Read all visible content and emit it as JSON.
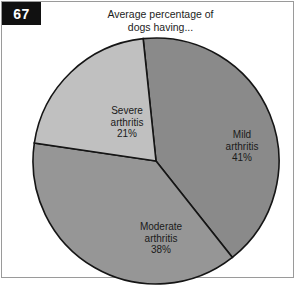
{
  "figure": {
    "number_badge": "67",
    "title_line1": "Average percentage of",
    "title_line2": "dogs having..."
  },
  "chart_data": {
    "type": "pie",
    "title": "Average percentage of dogs having...",
    "subtitle": "",
    "xlabel": "",
    "ylabel": "",
    "legend_position": "none",
    "grid": false,
    "labels_inside_slices": true,
    "categories": [
      "Mild arthritis",
      "Moderate arthritis",
      "Severe arthritis"
    ],
    "values": [
      41,
      38,
      21
    ],
    "unit": "%",
    "start_angle_deg": -6,
    "direction": "clockwise",
    "slices": [
      {
        "name": "Mild arthritis",
        "label_line1": "Mild",
        "label_line2": "arthritis",
        "value_label": "41%",
        "value": 41,
        "color": "#8a8a8a"
      },
      {
        "name": "Moderate arthritis",
        "label_line1": "Moderate",
        "label_line2": "arthritis",
        "value_label": "38%",
        "value": 38,
        "color": "#969696"
      },
      {
        "name": "Severe arthritis",
        "label_line1": "Severe",
        "label_line2": "arthritis",
        "value_label": "21%",
        "value": 21,
        "color": "#c0c0c0"
      }
    ],
    "outline_color": "#151515",
    "background_color": "#ffffff"
  }
}
